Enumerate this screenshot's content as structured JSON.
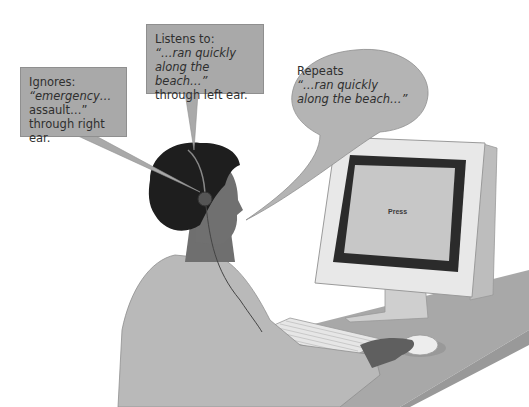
{
  "ignores_box": {
    "line1": "Ignores:",
    "line2": "“emergency…",
    "line3": "assault…”",
    "line4": "through right ear."
  },
  "listens_box": {
    "line1": "Listens to:",
    "line2": "“…ran quickly",
    "line3": "along the beach…”",
    "line4": "through left ear."
  },
  "repeats_bubble": {
    "line1": "Repeats",
    "line2": "“…ran quickly",
    "line3": "along the beach…”"
  },
  "monitor": {
    "screen_text": "Press"
  },
  "colors": {
    "box_fill": "#a9a9a9",
    "bubble_fill": "#b4b4b4",
    "monitor_frame": "#e8e8e8",
    "screen_border": "#2b2b2b",
    "screen_fill": "#c7c7c7",
    "desk": "#a8a8a8",
    "hair": "#1e1e1e",
    "skin": "#6f6f6f",
    "shirt": "#b9b9b9"
  }
}
